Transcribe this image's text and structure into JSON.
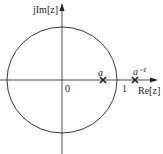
{
  "diagram": {
    "axes": {
      "imag_label": "jIm[z]",
      "real_label": "Re[z]",
      "origin_label": "0",
      "unit_label": "1"
    },
    "unit_circle": {
      "radius": 1
    },
    "poles": [
      {
        "label": "a",
        "marker": "cross-icon"
      },
      {
        "label": "a⁻¹",
        "marker": "cross-icon"
      }
    ],
    "colors": {
      "stroke": "#222222",
      "background": "#ffffff"
    }
  }
}
